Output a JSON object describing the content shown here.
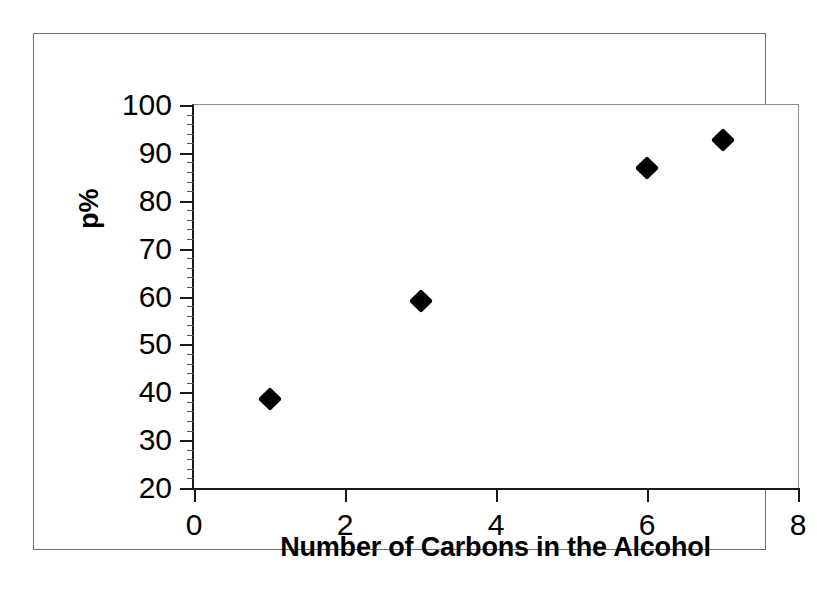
{
  "chart_data": {
    "type": "scatter",
    "title": "",
    "xlabel": "Number of Carbons in the Alcohol",
    "ylabel": "p%",
    "xlim": [
      0,
      8
    ],
    "ylim": [
      20,
      100
    ],
    "x_ticks": [
      0,
      2,
      4,
      6,
      8
    ],
    "y_ticks": [
      20,
      30,
      40,
      50,
      60,
      70,
      80,
      90,
      100
    ],
    "x_tick_labels": [
      "0",
      "2",
      "4",
      "6",
      "8"
    ],
    "y_tick_labels": [
      "20",
      "30",
      "40",
      "50",
      "60",
      "70",
      "80",
      "90",
      "100"
    ],
    "grid": false,
    "legend": false,
    "marker": "diamond",
    "marker_color": "#000000",
    "series": [
      {
        "name": "p%",
        "points": [
          {
            "x": 1,
            "y": 38.6
          },
          {
            "x": 3,
            "y": 59.0
          },
          {
            "x": 6,
            "y": 86.8
          },
          {
            "x": 7,
            "y": 92.7
          }
        ]
      }
    ]
  },
  "figure": {
    "border_color": "#6f6f6f",
    "axis_color": "#1a1a1a",
    "background": "#ffffff"
  }
}
